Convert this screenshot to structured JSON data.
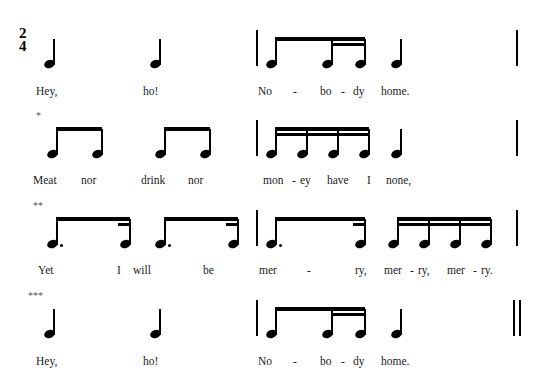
{
  "score": {
    "time_signature": {
      "numerator": "2",
      "denominator": "4"
    },
    "systems": [
      {
        "id": "system-1",
        "footnote_marker": "",
        "end_barline": "single",
        "lyrics": [
          {
            "text": "Hey,",
            "x": 36,
            "y": 85
          },
          {
            "text": "ho!",
            "x": 143,
            "y": 85
          },
          {
            "text": "No",
            "x": 258,
            "y": 85
          },
          {
            "text": "-",
            "x": 293,
            "y": 85
          },
          {
            "text": "bo",
            "x": 320,
            "y": 85
          },
          {
            "text": "-",
            "x": 341,
            "y": 85
          },
          {
            "text": "dy",
            "x": 353,
            "y": 85
          },
          {
            "text": "home.",
            "x": 381,
            "y": 85
          }
        ]
      },
      {
        "id": "system-2",
        "footnote_marker": "*",
        "end_barline": "single",
        "lyrics": [
          {
            "text": "Meat",
            "x": 33,
            "y": 174
          },
          {
            "text": "nor",
            "x": 81,
            "y": 174
          },
          {
            "text": "drink",
            "x": 141,
            "y": 174
          },
          {
            "text": "nor",
            "x": 188,
            "y": 174
          },
          {
            "text": "mon",
            "x": 263,
            "y": 174
          },
          {
            "text": "-",
            "x": 292,
            "y": 174
          },
          {
            "text": "ey",
            "x": 300,
            "y": 174
          },
          {
            "text": "have",
            "x": 327,
            "y": 174
          },
          {
            "text": "I",
            "x": 367,
            "y": 174
          },
          {
            "text": "none,",
            "x": 386,
            "y": 174
          }
        ]
      },
      {
        "id": "system-3",
        "footnote_marker": "**",
        "end_barline": "single",
        "lyrics": [
          {
            "text": "Yet",
            "x": 38,
            "y": 264
          },
          {
            "text": "I",
            "x": 117,
            "y": 264
          },
          {
            "text": "will",
            "x": 133,
            "y": 264
          },
          {
            "text": "be",
            "x": 203,
            "y": 264
          },
          {
            "text": "mer",
            "x": 259,
            "y": 264
          },
          {
            "text": "-",
            "x": 307,
            "y": 264
          },
          {
            "text": "ry,",
            "x": 355,
            "y": 264
          },
          {
            "text": "mer",
            "x": 384,
            "y": 264
          },
          {
            "text": "-",
            "x": 410,
            "y": 264
          },
          {
            "text": "ry,",
            "x": 418,
            "y": 264
          },
          {
            "text": "mer",
            "x": 447,
            "y": 264
          },
          {
            "text": "-",
            "x": 473,
            "y": 264
          },
          {
            "text": "ry.",
            "x": 481,
            "y": 264
          }
        ]
      },
      {
        "id": "system-4",
        "footnote_marker": "***",
        "end_barline": "double",
        "lyrics": [
          {
            "text": "Hey,",
            "x": 36,
            "y": 355
          },
          {
            "text": "ho!",
            "x": 143,
            "y": 355
          },
          {
            "text": "No",
            "x": 258,
            "y": 355
          },
          {
            "text": "-",
            "x": 293,
            "y": 355
          },
          {
            "text": "bo",
            "x": 320,
            "y": 355
          },
          {
            "text": "-",
            "x": 341,
            "y": 355
          },
          {
            "text": "dy",
            "x": 353,
            "y": 355
          },
          {
            "text": "home.",
            "x": 381,
            "y": 355
          }
        ]
      }
    ],
    "colors": {
      "ink": "#111111",
      "lyric": "#1a1a1a",
      "marker": "#555555"
    }
  }
}
